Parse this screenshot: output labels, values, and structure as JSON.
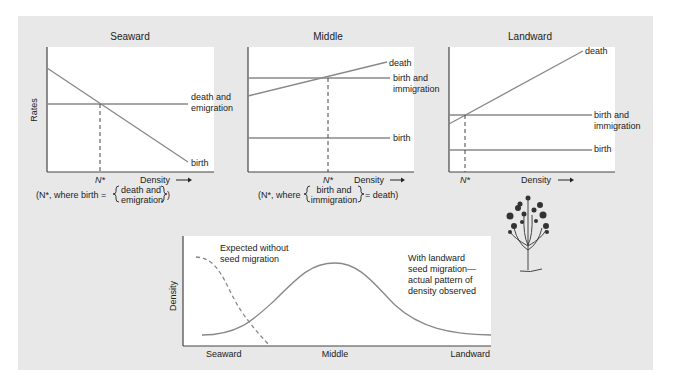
{
  "panels": [
    {
      "title": "Seaward",
      "ylabel": "Rates",
      "xlabel": "Density",
      "nstar": "N*",
      "lines": [
        {
          "label_line1": "death and",
          "label_line2": "emigration"
        },
        {
          "label_line1": "birth"
        }
      ],
      "caption_prefix": "(N*, where birth =",
      "caption_brace_line1": "death and",
      "caption_brace_line2": "emigration",
      "caption_suffix": ")"
    },
    {
      "title": "Middle",
      "xlabel": "Density",
      "nstar": "N*",
      "lines": [
        {
          "label_line1": "death"
        },
        {
          "label_line1": "birth and",
          "label_line2": "immigration"
        },
        {
          "label_line1": "birth"
        }
      ],
      "caption_prefix": "(N*, where",
      "caption_brace_line1": "birth and",
      "caption_brace_line2": "immigration",
      "caption_suffix": "= death)"
    },
    {
      "title": "Landward",
      "xlabel": "Density",
      "nstar": "N*",
      "lines": [
        {
          "label_line1": "death"
        },
        {
          "label_line1": "birth and",
          "label_line2": "immigration"
        },
        {
          "label_line1": "birth"
        }
      ]
    }
  ],
  "bottom": {
    "ylabel": "Density",
    "xticks": [
      "Seaward",
      "Middle",
      "Landward"
    ],
    "dashed_label_line1": "Expected without",
    "dashed_label_line2": "seed migration",
    "solid_label_line1": "With landward",
    "solid_label_line2": "seed migration—",
    "solid_label_line3": "actual pattern of",
    "solid_label_line4": "density observed"
  },
  "colors": {
    "panel": "#e8e8e8",
    "plot_bg": "#ffffff",
    "axis": "#444444",
    "line": "#888888"
  }
}
